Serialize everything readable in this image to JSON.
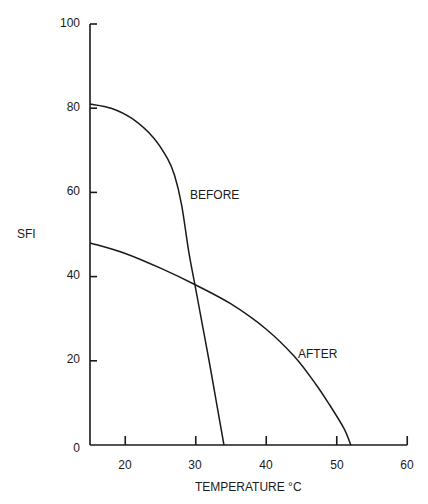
{
  "chart_data": {
    "type": "line",
    "title": "",
    "xlabel": "TEMPERATURE °C",
    "ylabel": "SFI",
    "xlim": [
      15,
      60
    ],
    "ylim": [
      0,
      100
    ],
    "x_ticks": [
      20,
      30,
      40,
      50,
      60
    ],
    "y_ticks": [
      0,
      20,
      40,
      60,
      80,
      100
    ],
    "grid": false,
    "legend": "inline labels",
    "series": [
      {
        "name": "BEFORE",
        "x": [
          15,
          18,
          21,
          24,
          26,
          27,
          28,
          29,
          30,
          31,
          32,
          33,
          34
        ],
        "y": [
          81,
          80,
          77.5,
          73,
          68,
          64,
          57,
          46,
          37,
          28,
          19,
          9.5,
          0
        ]
      },
      {
        "name": "AFTER",
        "x": [
          15,
          20,
          25,
          30,
          35,
          40,
          44,
          47,
          49,
          51,
          52
        ],
        "y": [
          48,
          45.5,
          42,
          38,
          33.5,
          27.5,
          21,
          14.5,
          9.5,
          4,
          0
        ]
      }
    ],
    "annotations": [
      {
        "text": "BEFORE",
        "x": 29.5,
        "y": 59
      },
      {
        "text": "AFTER",
        "x": 44,
        "y": 19.5
      }
    ]
  },
  "labels": {
    "ylabel": "SFI",
    "xlabel": "TEMPERATURE °C",
    "before": "BEFORE",
    "after": "AFTER",
    "y": [
      "100",
      "80",
      "60",
      "40",
      "20",
      "0"
    ],
    "x": [
      "20",
      "30",
      "40",
      "50",
      "60"
    ]
  }
}
